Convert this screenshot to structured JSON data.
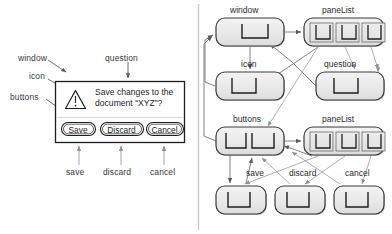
{
  "figure": {
    "type": "diagram",
    "background": "#ffffff",
    "divider_color": "#c9c9c9",
    "line_color": "#6e6e6e",
    "ink_color": "#2b2b2b"
  },
  "left_panel": {
    "title_annotations": [
      {
        "name": "window",
        "label": "window",
        "x": 18,
        "y": 57
      },
      {
        "name": "icon",
        "label": "icon",
        "x": 29,
        "y": 75
      },
      {
        "name": "buttons",
        "label": "buttons",
        "x": 12,
        "y": 96
      },
      {
        "name": "question",
        "label": "question",
        "x": 98,
        "y": 57
      }
    ],
    "bottom_annotations": [
      {
        "name": "save",
        "label": "save",
        "x": 71,
        "y": 171
      },
      {
        "name": "discard",
        "label": "discard",
        "x": 104,
        "y": 171
      },
      {
        "name": "cancel",
        "label": "cancel",
        "x": 148,
        "y": 171
      }
    ],
    "dialog": {
      "name": "save-changes-dialog",
      "x": 55,
      "y": 81,
      "w": 130,
      "h": 62,
      "border_color": "#1e1e1e",
      "fill": "#ffffff",
      "warning_icon": "warning-triangle-icon",
      "message_line1": "Save changes to the",
      "message_line2": "document “XYZ”?",
      "buttons": [
        {
          "name": "save-button",
          "label": "Save",
          "x": 61,
          "y": 122,
          "w": 34
        },
        {
          "name": "discard-button",
          "label": "Discard",
          "x": 100,
          "y": 122,
          "w": 43
        },
        {
          "name": "cancel-button",
          "label": "Cancel",
          "x": 146,
          "y": 122,
          "w": 37
        }
      ]
    }
  },
  "right_panel": {
    "node_glyph": "corner-pane-icon",
    "nodes": [
      {
        "name": "node-window",
        "label": "window",
        "label_x": 232,
        "label_y": 9,
        "x": 216,
        "y": 18,
        "w": 68,
        "h": 28,
        "panes": 1
      },
      {
        "name": "node-panelist-1",
        "label": "paneList",
        "label_x": 322,
        "label_y": 9,
        "x": 304,
        "y": 18,
        "w": 80,
        "h": 28,
        "panes": 3
      },
      {
        "name": "node-icon",
        "label": "icon",
        "label_x": 241,
        "label_y": 62,
        "x": 216,
        "y": 72,
        "w": 68,
        "h": 28,
        "panes": 1
      },
      {
        "name": "node-question",
        "label": "question",
        "label_x": 324,
        "label_y": 62,
        "x": 316,
        "y": 72,
        "w": 68,
        "h": 28,
        "panes": 1
      },
      {
        "name": "node-buttons",
        "label": "buttons",
        "label_x": 235,
        "label_y": 117,
        "x": 216,
        "y": 127,
        "w": 68,
        "h": 28,
        "panes": 2
      },
      {
        "name": "node-panelist-2",
        "label": "paneList",
        "label_x": 322,
        "label_y": 117,
        "x": 304,
        "y": 127,
        "w": 80,
        "h": 28,
        "panes": 3
      },
      {
        "name": "node-save",
        "label": "save",
        "label_x": 249,
        "label_y": 172,
        "x": 216,
        "y": 186,
        "w": 50,
        "h": 28,
        "panes": 1
      },
      {
        "name": "node-discard",
        "label": "discard",
        "label_x": 292,
        "label_y": 172,
        "x": 275,
        "y": 186,
        "w": 50,
        "h": 28,
        "panes": 1
      },
      {
        "name": "node-cancel",
        "label": "cancel",
        "label_x": 344,
        "label_y": 172,
        "x": 334,
        "y": 186,
        "w": 50,
        "h": 28,
        "panes": 1
      }
    ],
    "edges": [
      {
        "name": "edge-window-to-panelist1",
        "from": "node-window",
        "to": "node-panelist-1"
      },
      {
        "name": "edge-window-to-icon",
        "from": "node-window",
        "to": "node-icon"
      },
      {
        "name": "edge-panelist1-to-icon",
        "from": "node-panelist-1",
        "to": "node-icon"
      },
      {
        "name": "edge-panelist1-to-question",
        "from": "node-panelist-1",
        "to": "node-question"
      },
      {
        "name": "edge-panelist1-to-buttons",
        "from": "node-panelist-1",
        "to": "node-buttons"
      },
      {
        "name": "edge-icon-to-window",
        "from": "node-icon",
        "to": "node-window"
      },
      {
        "name": "edge-question-to-window",
        "from": "node-question",
        "to": "node-window"
      },
      {
        "name": "edge-buttons-to-window",
        "from": "node-buttons",
        "to": "node-window"
      },
      {
        "name": "edge-buttons-to-panelist2",
        "from": "node-buttons",
        "to": "node-panelist-2"
      },
      {
        "name": "edge-buttons-to-save",
        "from": "node-buttons",
        "to": "node-save"
      },
      {
        "name": "edge-panelist2-to-save",
        "from": "node-panelist-2",
        "to": "node-save"
      },
      {
        "name": "edge-panelist2-to-discard",
        "from": "node-panelist-2",
        "to": "node-discard"
      },
      {
        "name": "edge-panelist2-to-cancel",
        "from": "node-panelist-2",
        "to": "node-cancel"
      },
      {
        "name": "edge-save-to-buttons",
        "from": "node-save",
        "to": "node-buttons"
      },
      {
        "name": "edge-discard-to-buttons",
        "from": "node-discard",
        "to": "node-buttons"
      },
      {
        "name": "edge-cancel-to-buttons",
        "from": "node-cancel",
        "to": "node-buttons"
      }
    ]
  }
}
